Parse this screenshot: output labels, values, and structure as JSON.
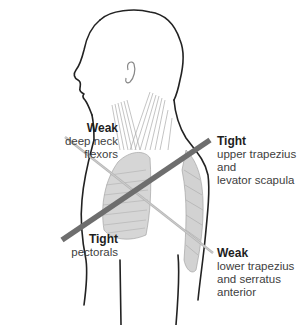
{
  "figure": {
    "colors": {
      "tight_line": "#6e6e6e",
      "weak_line": "#b8b8b8",
      "outline": "#222222",
      "muscle_fill": "#c8c8c8",
      "label_heading": "#1e1e1e",
      "label_text": "#404040"
    },
    "labels": [
      {
        "id": "weak-upper",
        "heading": "Weak",
        "text": "deep neck\nflexors"
      },
      {
        "id": "tight-upper",
        "heading": "Tight",
        "text": "upper trapezius\nand\nlevator scapula"
      },
      {
        "id": "tight-lower",
        "heading": "Tight",
        "text": "pectorals"
      },
      {
        "id": "weak-lower",
        "heading": "Weak",
        "text": "lower trapezius\nand serratus\nanterior"
      }
    ],
    "icons": {
      "figure": "human-head-torso-profile",
      "tight_line": "thick-diagonal-line",
      "weak_line": "thin-diagonal-line"
    }
  }
}
